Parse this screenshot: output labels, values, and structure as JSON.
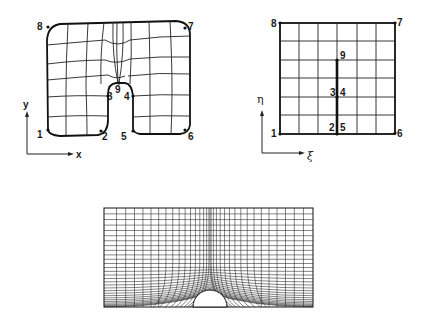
{
  "physical_domain": {
    "axes": {
      "x_label": "x",
      "y_label": "y"
    },
    "points": [
      {
        "id": "1",
        "label": "1"
      },
      {
        "id": "2",
        "label": "2"
      },
      {
        "id": "3",
        "label": "3"
      },
      {
        "id": "4",
        "label": "4"
      },
      {
        "id": "5",
        "label": "5"
      },
      {
        "id": "6",
        "label": "6"
      },
      {
        "id": "7",
        "label": "7"
      },
      {
        "id": "8",
        "label": "8"
      },
      {
        "id": "9",
        "label": "9"
      }
    ]
  },
  "computational_domain": {
    "axes": {
      "x_label": "ξ",
      "y_label": "η"
    },
    "grid": {
      "columns": 6,
      "rows": 6
    },
    "points": [
      {
        "id": "1",
        "label": "1"
      },
      {
        "id": "2",
        "label": "2"
      },
      {
        "id": "5",
        "label": "5"
      },
      {
        "id": "6",
        "label": "6"
      },
      {
        "id": "7",
        "label": "7"
      },
      {
        "id": "8",
        "label": "8"
      },
      {
        "id": "3",
        "label": "3"
      },
      {
        "id": "4",
        "label": "4"
      },
      {
        "id": "9",
        "label": "9"
      }
    ]
  },
  "body_fitted_mesh": {
    "description": "Rectangular domain with semicircular cylinder at bottom center, clustered grid",
    "colors": {
      "line": "#222222",
      "background": "#ffffff"
    }
  }
}
